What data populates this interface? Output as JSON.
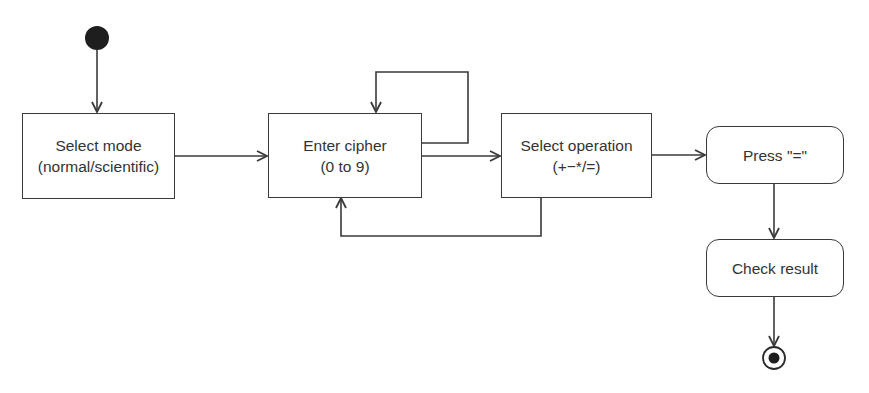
{
  "diagram": {
    "type": "uml-activity",
    "colors": {
      "stroke": "#3a3a3a",
      "text": "#333333",
      "background": "#ffffff",
      "fill": "#1e1e1e"
    },
    "nodes": [
      {
        "id": "start",
        "kind": "initial"
      },
      {
        "id": "select_mode",
        "kind": "action",
        "line1": "Select mode",
        "line2": "(normal/scientific)"
      },
      {
        "id": "enter_cipher",
        "kind": "action",
        "line1": "Enter cipher",
        "line2": "(0 to 9)"
      },
      {
        "id": "select_operation",
        "kind": "action",
        "line1": "Select operation",
        "line2": "(+−*/=)"
      },
      {
        "id": "press_equals",
        "kind": "activity",
        "line1": "Press \"=\""
      },
      {
        "id": "check_result",
        "kind": "activity",
        "line1": "Check result"
      },
      {
        "id": "end",
        "kind": "final"
      }
    ],
    "edges": [
      {
        "from": "start",
        "to": "select_mode"
      },
      {
        "from": "select_mode",
        "to": "enter_cipher"
      },
      {
        "from": "enter_cipher",
        "to": "enter_cipher",
        "note": "self-loop"
      },
      {
        "from": "enter_cipher",
        "to": "select_operation"
      },
      {
        "from": "select_operation",
        "to": "enter_cipher",
        "note": "loop back"
      },
      {
        "from": "select_operation",
        "to": "press_equals"
      },
      {
        "from": "press_equals",
        "to": "check_result"
      },
      {
        "from": "check_result",
        "to": "end"
      }
    ]
  }
}
